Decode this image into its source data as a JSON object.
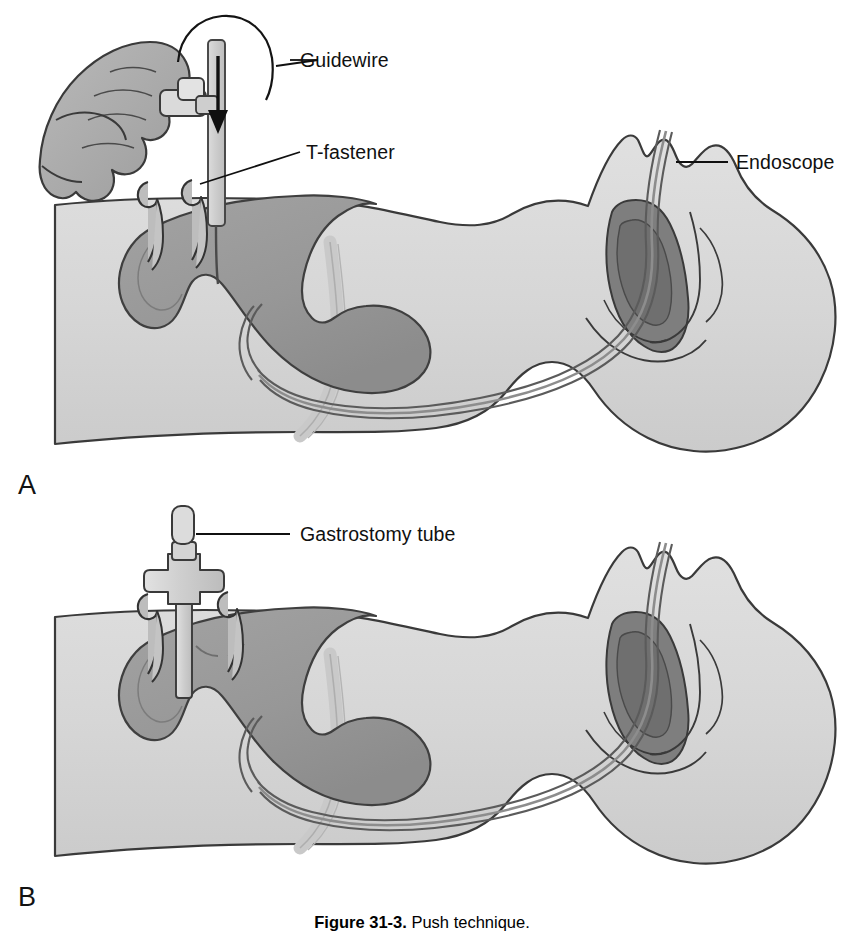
{
  "figure": {
    "number_label": "Figure 31-3.",
    "caption_text": "Push technique."
  },
  "panels": [
    {
      "id": "A",
      "letter": "A",
      "labels": [
        {
          "name": "guidewire",
          "text": "Guidewire"
        },
        {
          "name": "t-fastener",
          "text": "T-fastener"
        },
        {
          "name": "endoscope",
          "text": "Endoscope"
        }
      ],
      "annotations": [
        {
          "name": "push-direction-arrow",
          "text": ""
        }
      ]
    },
    {
      "id": "B",
      "letter": "B",
      "labels": [
        {
          "name": "gastrostomy-tube",
          "text": "Gastrostomy tube"
        }
      ],
      "annotations": []
    }
  ],
  "colors": {
    "background": "#ffffff",
    "body_fill": "#d5d5d5",
    "body_fill_light": "#dedede",
    "stomach_fill": "#9c9c9c",
    "stomach_dark": "#8a8a8a",
    "oral_cavity_dark": "#7d7d7d",
    "device_fill": "#c6c6c6",
    "device_highlight": "#e2e2e2",
    "trachea_fill": "#cfcfcf",
    "outline": "#2b2b2b",
    "outline_soft": "#555555",
    "text": "#101010"
  },
  "icons": {
    "arrow": "down-arrow-icon",
    "leader": "leader-line-icon"
  }
}
